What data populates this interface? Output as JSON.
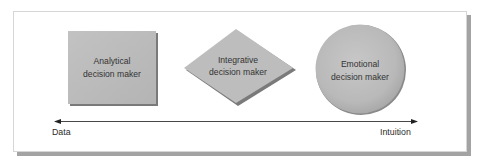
{
  "shapes": [
    {
      "id": "analytical",
      "shape": "square",
      "line1": "Analytical",
      "line2": "decision maker"
    },
    {
      "id": "integrative",
      "shape": "diamond",
      "line1": "Integrative",
      "line2": "decision maker"
    },
    {
      "id": "emotional",
      "shape": "circle",
      "line1": "Emotional",
      "line2": "decision maker"
    }
  ],
  "axis": {
    "left_label": "Data",
    "right_label": "Intuition",
    "direction": "bidirectional"
  },
  "colors": {
    "shape_fill": "#b8b8b8",
    "shape_shadow": "#7a7a7a",
    "frame_border": "#d6d6d6",
    "frame_shadow": "#a3a3a3",
    "text": "#333333",
    "axis_line": "#333333"
  }
}
